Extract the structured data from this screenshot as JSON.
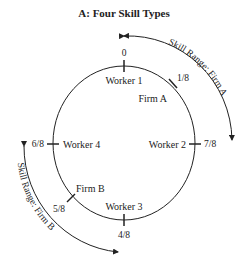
{
  "title": "A: Four Skill Types",
  "ticks": [
    {
      "label": "0",
      "name": "tick-0"
    },
    {
      "label": "1/8",
      "name": "tick-1-8"
    },
    {
      "label": "7/8",
      "name": "tick-2-8"
    },
    {
      "label": "4/8",
      "name": "tick-4-8"
    },
    {
      "label": "5/8",
      "name": "tick-5-8"
    },
    {
      "label": "6/8",
      "name": "tick-6-8"
    }
  ],
  "workers": [
    "Worker 1",
    "Worker 2",
    "Worker 3",
    "Worker 4"
  ],
  "firms": [
    "Firm A",
    "Firm B"
  ],
  "skill_ranges": {
    "firm_a": "Skill Range: Firm A",
    "firm_b": "Skill Range: Firm B"
  }
}
